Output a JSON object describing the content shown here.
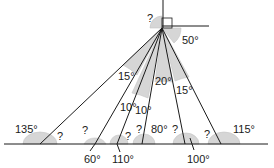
{
  "diagram": {
    "apex": {
      "x": 162,
      "y": 28
    },
    "baseline_y": 144,
    "top_labels": {
      "unknown": "?",
      "right_angle_value": "50°"
    },
    "apex_angles": [
      {
        "id": "a1",
        "text": "15°"
      },
      {
        "id": "a2",
        "text": "10°"
      },
      {
        "id": "a3",
        "text": "10°"
      },
      {
        "id": "a4",
        "text": "20°"
      },
      {
        "id": "a5",
        "text": "15°"
      }
    ],
    "baseline_angles": [
      {
        "id": "b1",
        "text": "135°"
      },
      {
        "id": "b2",
        "text": "?"
      },
      {
        "id": "b3",
        "text": "?"
      },
      {
        "id": "b4",
        "text": "60°"
      },
      {
        "id": "b5",
        "text": "110°"
      },
      {
        "id": "b6",
        "text": "?"
      },
      {
        "id": "b7",
        "text": "?"
      },
      {
        "id": "b8",
        "text": "80°"
      },
      {
        "id": "b9",
        "text": "?"
      },
      {
        "id": "b10",
        "text": "100°"
      },
      {
        "id": "b11",
        "text": "?"
      },
      {
        "id": "b12",
        "text": "115°"
      }
    ]
  }
}
